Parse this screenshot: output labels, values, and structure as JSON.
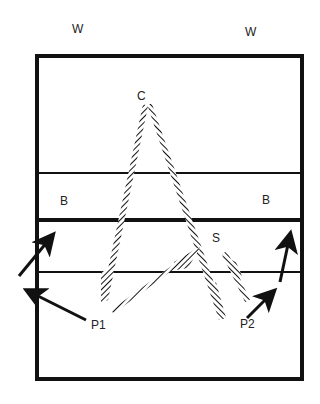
{
  "diagram": {
    "type": "court-play-diagram",
    "labels": {
      "wall_left": "W",
      "wall_right": "W",
      "center": "C",
      "bank_left": "B",
      "bank_right": "B",
      "server": "S",
      "player1": "P1",
      "player2": "P2"
    },
    "colors": {
      "ink": "#111111",
      "background": "#ffffff"
    },
    "court": {
      "outline": "thick rectangle",
      "lines": [
        "upper thin line",
        "middle thick line",
        "lower thin line"
      ]
    },
    "paths": [
      {
        "name": "ball-path-center-left",
        "style": "hatched",
        "from": "C",
        "to": "lower-left zone"
      },
      {
        "name": "ball-path-center-right",
        "style": "hatched",
        "from": "C",
        "to": "lower-right zone near S"
      },
      {
        "name": "ball-path-p1-diagonal",
        "style": "double-hatched",
        "from": "P1",
        "to": "below S"
      },
      {
        "name": "ball-path-server",
        "style": "hatched",
        "from": "S",
        "to": "lower-right"
      }
    ],
    "arrows": [
      {
        "name": "p1-arrow-left",
        "from": "P1",
        "direction": "up-left"
      },
      {
        "name": "left-outside-arrow",
        "direction": "up-right"
      },
      {
        "name": "p2-arrow",
        "from": "P2",
        "direction": "up-right"
      },
      {
        "name": "right-arrow-up",
        "direction": "up"
      }
    ]
  }
}
